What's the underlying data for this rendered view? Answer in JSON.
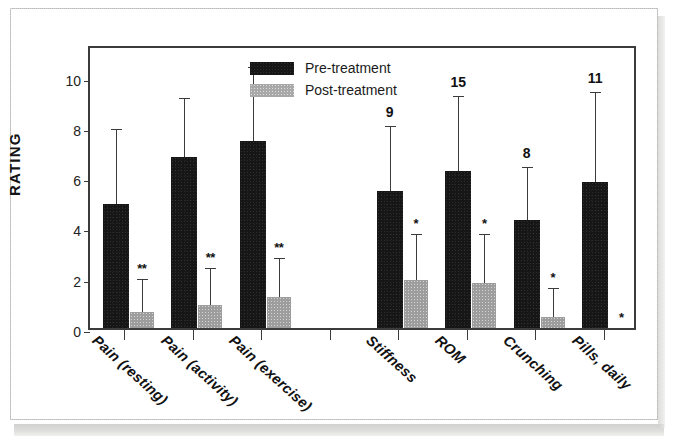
{
  "chart_data": {
    "type": "bar",
    "title": "",
    "xlabel": "",
    "ylabel": "RATING",
    "ylim": [
      0,
      11.3
    ],
    "yticks": [
      0,
      2,
      4,
      6,
      8,
      10
    ],
    "grid": false,
    "legend_position": "top-center",
    "categories": [
      "Pain (resting)",
      "Pain (activity)",
      "Pain (exercise)",
      "",
      "Stiffness",
      "ROM",
      "Crunching",
      "Pills, daily"
    ],
    "series": [
      {
        "name": "Pre-treatment",
        "color": "#161616",
        "values": [
          4.95,
          6.8,
          7.45,
          null,
          5.45,
          6.25,
          4.3,
          5.8
        ],
        "errors": [
          2.95,
          2.35,
          2.95,
          null,
          2.6,
          3.0,
          2.1,
          3.6
        ]
      },
      {
        "name": "Post-treatment",
        "color": "#9d9d9d",
        "values": [
          0.62,
          0.9,
          1.25,
          null,
          1.9,
          1.8,
          0.45,
          0.0
        ],
        "errors": [
          1.35,
          1.5,
          1.55,
          null,
          1.85,
          1.95,
          1.15,
          0.0
        ]
      }
    ],
    "significance_markers": [
      {
        "category": "Pain (resting)",
        "series": "Post-treatment",
        "label": "**"
      },
      {
        "category": "Pain (activity)",
        "series": "Post-treatment",
        "label": "**"
      },
      {
        "category": "Pain (exercise)",
        "series": "Post-treatment",
        "label": "**"
      },
      {
        "category": "Stiffness",
        "series": "Post-treatment",
        "label": "*"
      },
      {
        "category": "ROM",
        "series": "Post-treatment",
        "label": "*"
      },
      {
        "category": "Crunching",
        "series": "Post-treatment",
        "label": "*"
      },
      {
        "category": "Pills, daily",
        "series": "Post-treatment",
        "label": "*"
      }
    ],
    "top_annotations": [
      {
        "category": "Stiffness",
        "label": "9"
      },
      {
        "category": "ROM",
        "label": "15"
      },
      {
        "category": "Crunching",
        "label": "8"
      },
      {
        "category": "Pills, daily",
        "label": "11"
      }
    ]
  },
  "axis": {
    "y_title": "RATING",
    "y_tick_labels": [
      "10",
      "8",
      "6",
      "4",
      "2",
      "0"
    ]
  },
  "legend": {
    "items": [
      {
        "label": "Pre-treatment",
        "swatch": "black"
      },
      {
        "label": "Post-treatment",
        "swatch": "gray"
      }
    ]
  },
  "x_labels": [
    "Pain (resting)",
    "Pain (activity)",
    "Pain (exercise)",
    "Stiffness",
    "ROM",
    "Crunching",
    "Pills, daily"
  ],
  "colors": {
    "pre_treatment": "#161616",
    "post_treatment": "#9d9d9d",
    "axis": "#3b3b3b",
    "text": "#111111",
    "page_border": "#b9b9b7"
  }
}
